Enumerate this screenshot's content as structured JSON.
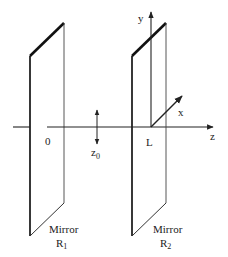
{
  "diagram": {
    "type": "optical-resonator",
    "labels": {
      "origin": "0",
      "z0": "z",
      "z0_sub": "0",
      "L": "L",
      "y_axis": "y",
      "x_axis": "x",
      "z_axis": "z",
      "mirror1_name": "Mirror",
      "mirror1_symbol": "R",
      "mirror1_sub": "1",
      "mirror2_name": "Mirror",
      "mirror2_symbol": "R",
      "mirror2_sub": "2"
    },
    "colors": {
      "line": "#222222",
      "background": "#ffffff"
    }
  }
}
